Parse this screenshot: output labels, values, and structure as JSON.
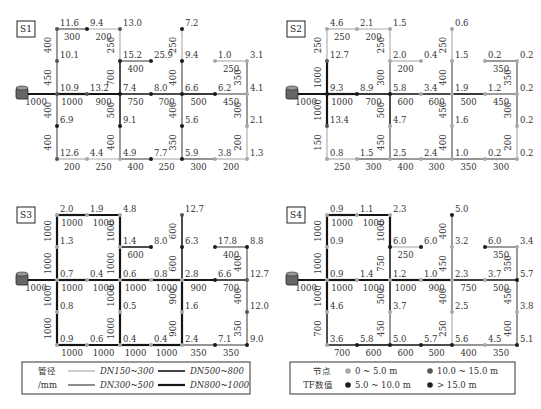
{
  "colors": {
    "pipe_150_300": "#b0b0b0",
    "pipe_300_500": "#707070",
    "pipe_500_800": "#3a3a3a",
    "pipe_800_1000": "#151515",
    "node_0_5": "#a8a8a8",
    "node_5_10": "#1a1a1a",
    "node_10_15": "#555555",
    "node_gt15": "#222222"
  },
  "panels": [
    {
      "id": "S1",
      "label": "S1",
      "nodes": {
        "a1": "11.6",
        "a2": "9.4",
        "a3": "13.0",
        "a5": "7.2",
        "b1": "10.1",
        "b3": "15.2",
        "b4": "25.9",
        "b5": "9.4",
        "b6": "1.0",
        "b7": "3.1",
        "c1": "10.9",
        "c2": "13.2",
        "c3": "7.4",
        "c4": "8.0",
        "c5": "6.6",
        "c6": "6.2",
        "c7": "4.1",
        "d1": "6.9",
        "d3": "9.1",
        "d5": "5.6",
        "d7": "2.1",
        "e1": "12.6",
        "e2": "4.4",
        "e3": "4.9",
        "e4": "7.7",
        "e5": "5.9",
        "e6": "3.8",
        "e7": "1.3"
      },
      "pipes": {
        "top1": "300",
        "top2": "200",
        "v_a1b1": "400",
        "v_b1c1": "450",
        "v_a3b3": "250",
        "v_b3c3": "700",
        "b3b4": "400",
        "v_a5b5": "250",
        "v_b5c5": "400",
        "b6b7": "250",
        "v_b7c7": "350",
        "src": "1000",
        "c1c2": "1000",
        "c2c3": "900",
        "c3c4": "750",
        "c4c5": "700",
        "c5c6": "500",
        "c6c7": "450",
        "v_c1d1": "400",
        "v_d1e1": "400",
        "v_c3d3": "500",
        "v_d3e3": "400",
        "v_c5d5": "400",
        "v_d5e5": "350",
        "v_c7d7": "300",
        "v_d7e7": "200",
        "e1e2": "200",
        "e2e3": "250",
        "e3e4": "400",
        "e4e5": "250",
        "e5e6": "300",
        "e6e7": "200"
      }
    },
    {
      "id": "S2",
      "label": "S2",
      "nodes": {
        "a1": "4.6",
        "a2": "2.1",
        "a3": "1.5",
        "a5": "0.6",
        "b1": "12.7",
        "b3": "2.0",
        "b4": "0.4",
        "b5": "1.5",
        "b6": "0.2",
        "b7": "0.2",
        "c1": "9.3",
        "c2": "8.9",
        "c3": "5.8",
        "c4": "3.4",
        "c5": "1.9",
        "c6": "1.2",
        "c7": "0.2",
        "d1": "13.4",
        "d3": "4.7",
        "d5": "1.6",
        "d7": "0.2",
        "e1": "0.8",
        "e2": "1.5",
        "e3": "2.5",
        "e4": "2.4",
        "e5": "1.0",
        "e6": "0.2",
        "e7": "0.2"
      },
      "pipes": {
        "top1": "250",
        "top2": "200",
        "v_a1b1": "250",
        "v_b1c1": "1000",
        "v_a3b3": "250",
        "v_b3c3": "300",
        "b3b4": "200",
        "v_a5b5": "250",
        "v_b5c5": "400",
        "b6b7": "350",
        "v_b7c7": "350",
        "src": "1000",
        "c1c2": "1000",
        "c2c3": "700",
        "c3c4": "600",
        "c4c5": "600",
        "c5c6": "500",
        "c6c7": "450",
        "v_c1d1": "1000",
        "v_d1e1": "150",
        "v_c3d3": "500",
        "v_d3e3": "450",
        "v_c5d5": "450",
        "v_d5e5": "400",
        "v_c7d7": "300",
        "v_d7e7": "200",
        "e1e2": "250",
        "e2e3": "300",
        "e3e4": "400",
        "e4e5": "300",
        "e5e6": "350",
        "e6e7": "300"
      }
    },
    {
      "id": "S3",
      "label": "S3",
      "nodes": {
        "a1": "2.0",
        "a2": "1.9",
        "a3": "4.8",
        "a5": "12.7",
        "b1": "1.3",
        "b3": "1.4",
        "b4": "8.0",
        "b5": "6.3",
        "b6": "17.8",
        "b7": "8.8",
        "c1": "0.7",
        "c2": "0.4",
        "c3": "0.6",
        "c4": "0.8",
        "c5": "2.8",
        "c6": "6.6",
        "c7": "12.7",
        "d1": "0.8",
        "d3": "0.5",
        "d5": "1.6",
        "d7": "12.0",
        "e1": "0.9",
        "e2": "0.6",
        "e3": "0.4",
        "e4": "0.4",
        "e5": "2.4",
        "e6": "7.1",
        "e7": "9.0"
      },
      "pipes": {
        "top1": "1000",
        "top2": "1000",
        "v_a1b1": "1000",
        "v_b1c1": "1000",
        "v_a3b3": "1000",
        "v_b3c3": "1000",
        "b3b4": "600",
        "v_a5b5": "600",
        "v_b5c5": "600",
        "b6b7": "400",
        "v_b7c7": "400",
        "src": "1000",
        "c1c2": "1000",
        "c2c3": "1000",
        "c3c4": "1000",
        "c4c5": "1000",
        "c5c6": "900",
        "c6c7": "700",
        "v_c1d1": "1000",
        "v_d1e1": "1000",
        "v_c3d3": "1000",
        "v_d3e3": "1000",
        "v_c5d5": "900",
        "v_d5e5": "900",
        "v_c7d7": "400",
        "v_d7e7": "350",
        "e1e2": "1000",
        "e2e3": "1000",
        "e3e4": "1000",
        "e4e5": "1000",
        "e5e6": "350",
        "e6e7": "350"
      }
    },
    {
      "id": "S4",
      "label": "S4",
      "nodes": {
        "a1": "0.9",
        "a2": "1.1",
        "a3": "2.3",
        "a5": "5.0",
        "b1": "0.9",
        "b3": "6.0",
        "b4": "6.0",
        "b5": "3.2",
        "b6": "6.0",
        "b7": "3.4",
        "c1": "0.9",
        "c2": "1.4",
        "c3": "1.2",
        "c4": "1.0",
        "c5": "2.3",
        "c6": "3.7",
        "c7": "5.7",
        "d1": "4.6",
        "d3": "3.7",
        "d5": "2.5",
        "d7": "3.8",
        "e1": "3.6",
        "e2": "5.8",
        "e3": "5.0",
        "e4": "5.7",
        "e5": "5.6",
        "e6": "4.5",
        "e7": "5.1"
      },
      "pipes": {
        "top1": "1000",
        "top2": "1000",
        "v_a1b1": "1000",
        "v_b1c1": "1000",
        "v_a3b3": "1000",
        "v_b3c3": "750",
        "b3b4": "250",
        "v_a5b5": "400",
        "v_b5c5": "450",
        "b6b7": "350",
        "v_b7c7": "350",
        "src": "1000",
        "c1c2": "1000",
        "c2c3": "1000",
        "c3c4": "1000",
        "c4c5": "900",
        "c5c6": "750",
        "c6c7": "500",
        "v_c1d1": "1000",
        "v_d1e1": "700",
        "v_c3d3": "500",
        "v_d3e3": "450",
        "v_c5d5": "400",
        "v_d5e5": "250",
        "v_c7d7": "450",
        "v_d7e7": "400",
        "e1e2": "700",
        "e2e3": "600",
        "e3e4": "600",
        "e4e5": "500",
        "e5e6": "400",
        "e6e7": "350"
      }
    }
  ],
  "legend_pipe": {
    "title_line1": "管径",
    "title_line2": "/mm",
    "items": [
      "DN150~300",
      "DN300~500",
      "DN500~800",
      "DN800~1000"
    ]
  },
  "legend_node": {
    "title_line1": "节点",
    "title_line2": "TF数值",
    "items": [
      "0 ~ 5.0 m",
      "5.0 ~ 10.0 m",
      "10.0 ~ 15.0 m",
      "> 15.0 m"
    ]
  }
}
